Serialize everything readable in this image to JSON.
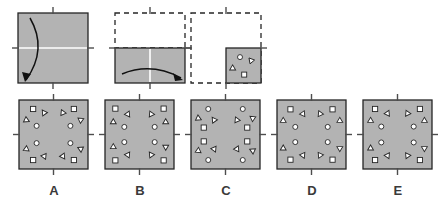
{
  "puzzle": {
    "type": "paper-folding-hole-punch",
    "fill_color": "#b3b3b3",
    "stroke_color": "#262626",
    "fold_line_color": "#ffffff",
    "tick_color": "#4d4d4d",
    "background_color": "#ffffff",
    "shape_fill": "#ffffff",
    "shape_stroke": "#262626"
  },
  "prompt_row": {
    "name": "folding-sequence",
    "steps": [
      {
        "id": "step-1",
        "name": "unfolded-sheet-with-horizontal-fold",
        "square": {
          "x": 18,
          "y": 13,
          "size": 70
        },
        "filled": true,
        "outline_style": "solid",
        "fold_lines": [
          {
            "orientation": "horizontal",
            "position": 0.5
          }
        ],
        "ticks": [
          "top",
          "bottom",
          "left",
          "right"
        ],
        "arrow": {
          "name": "fold-arrow-down",
          "from": [
            30,
            18
          ],
          "to": [
            26,
            80
          ],
          "curve": "bow-left",
          "description": "top edge folds down to bottom"
        }
      },
      {
        "id": "step-2",
        "name": "half-folded-sheet-with-vertical-fold",
        "square": {
          "x": 115,
          "y": 13,
          "size": 70
        },
        "dashed_region": {
          "x": 115,
          "y": 13,
          "width": 70,
          "height": 35
        },
        "filled_region": {
          "x": 115,
          "y": 48,
          "width": 70,
          "height": 35
        },
        "outline_style": "dashed-top-solid-bottom",
        "fold_lines": [
          {
            "orientation": "vertical",
            "position": 0.5
          }
        ],
        "ticks": [
          "top",
          "bottom",
          "left",
          "right"
        ],
        "arrow": {
          "name": "fold-arrow-right",
          "from": [
            122,
            74
          ],
          "to": [
            181,
            78
          ],
          "curve": "bow-up",
          "description": "left half folds right onto right half"
        }
      },
      {
        "id": "step-3",
        "name": "folded-quarter-with-punched-holes",
        "square": {
          "x": 191,
          "y": 13,
          "size": 70
        },
        "dashed_region": {
          "x": 191,
          "y": 13,
          "width": 70,
          "height": 70
        },
        "filled_region": {
          "x": 226,
          "y": 48,
          "width": 35,
          "height": 35
        },
        "outline_style": "dashed-with-solid-quarter",
        "ticks": [
          "top",
          "bottom",
          "left",
          "right"
        ],
        "holes": [
          {
            "shape": "circle",
            "x": 0.4,
            "y": 0.26,
            "size": 5.0,
            "rotation": 0
          },
          {
            "shape": "triangle",
            "x": 0.72,
            "y": 0.36,
            "size": 5.5,
            "rotation": 200
          },
          {
            "shape": "triangle",
            "x": 0.19,
            "y": 0.58,
            "size": 5.5,
            "rotation": 120
          },
          {
            "shape": "square",
            "x": 0.52,
            "y": 0.76,
            "size": 5.0,
            "rotation": 0
          }
        ]
      }
    ]
  },
  "options_row": {
    "name": "answer-options",
    "square_size": 69,
    "square_top": 100,
    "options": [
      {
        "id": "option-a",
        "label": "A",
        "square": {
          "x": 19,
          "y": 100,
          "size": 69
        },
        "label_x": 19,
        "label_y": 183,
        "ticks": [
          "top",
          "bottom",
          "left",
          "right"
        ],
        "holes": [
          {
            "shape": "square",
            "x": 0.205,
            "y": 0.13,
            "size": 5.2,
            "rotation": 0
          },
          {
            "shape": "triangle",
            "x": 0.365,
            "y": 0.185,
            "size": 5.4,
            "rotation": 205
          },
          {
            "shape": "triangle",
            "x": 0.105,
            "y": 0.29,
            "size": 5.4,
            "rotation": 115
          },
          {
            "shape": "circle",
            "x": 0.255,
            "y": 0.375,
            "size": 5.0,
            "rotation": 0
          },
          {
            "shape": "square",
            "x": 0.795,
            "y": 0.13,
            "size": 5.2,
            "rotation": 0
          },
          {
            "shape": "triangle",
            "x": 0.635,
            "y": 0.185,
            "size": 5.4,
            "rotation": 335
          },
          {
            "shape": "triangle",
            "x": 0.895,
            "y": 0.29,
            "size": 5.4,
            "rotation": 65
          },
          {
            "shape": "circle",
            "x": 0.745,
            "y": 0.375,
            "size": 5.0,
            "rotation": 0
          },
          {
            "shape": "square",
            "x": 0.205,
            "y": 0.87,
            "size": 5.2,
            "rotation": 0
          },
          {
            "shape": "triangle",
            "x": 0.365,
            "y": 0.815,
            "size": 5.4,
            "rotation": 155
          },
          {
            "shape": "triangle",
            "x": 0.105,
            "y": 0.71,
            "size": 5.4,
            "rotation": 245
          },
          {
            "shape": "circle",
            "x": 0.255,
            "y": 0.625,
            "size": 5.0,
            "rotation": 0
          },
          {
            "shape": "square",
            "x": 0.795,
            "y": 0.87,
            "size": 5.2,
            "rotation": 0
          },
          {
            "shape": "triangle",
            "x": 0.635,
            "y": 0.815,
            "size": 5.4,
            "rotation": 25
          },
          {
            "shape": "triangle",
            "x": 0.895,
            "y": 0.71,
            "size": 5.4,
            "rotation": 295
          },
          {
            "shape": "circle",
            "x": 0.745,
            "y": 0.625,
            "size": 5.0,
            "rotation": 0
          }
        ]
      },
      {
        "id": "option-b",
        "label": "B",
        "square": {
          "x": 105,
          "y": 100,
          "size": 69
        },
        "label_x": 105,
        "label_y": 183,
        "ticks": [
          "top",
          "bottom",
          "left",
          "right"
        ],
        "holes": [
          {
            "shape": "square",
            "x": 0.15,
            "y": 0.125,
            "size": 5.2,
            "rotation": 0
          },
          {
            "shape": "triangle",
            "x": 0.33,
            "y": 0.205,
            "size": 5.4,
            "rotation": 25
          },
          {
            "shape": "triangle",
            "x": 0.12,
            "y": 0.32,
            "size": 5.4,
            "rotation": 120
          },
          {
            "shape": "circle",
            "x": 0.28,
            "y": 0.39,
            "size": 5.0,
            "rotation": 0
          },
          {
            "shape": "square",
            "x": 0.85,
            "y": 0.125,
            "size": 5.2,
            "rotation": 0
          },
          {
            "shape": "triangle",
            "x": 0.67,
            "y": 0.205,
            "size": 5.4,
            "rotation": 335
          },
          {
            "shape": "triangle",
            "x": 0.88,
            "y": 0.32,
            "size": 5.4,
            "rotation": 240
          },
          {
            "shape": "circle",
            "x": 0.72,
            "y": 0.39,
            "size": 5.0,
            "rotation": 0
          },
          {
            "shape": "square",
            "x": 0.15,
            "y": 0.875,
            "size": 5.2,
            "rotation": 0
          },
          {
            "shape": "triangle",
            "x": 0.33,
            "y": 0.795,
            "size": 5.4,
            "rotation": 155
          },
          {
            "shape": "triangle",
            "x": 0.12,
            "y": 0.68,
            "size": 5.4,
            "rotation": 240
          },
          {
            "shape": "circle",
            "x": 0.28,
            "y": 0.61,
            "size": 5.0,
            "rotation": 0
          },
          {
            "shape": "square",
            "x": 0.85,
            "y": 0.875,
            "size": 5.2,
            "rotation": 0
          },
          {
            "shape": "triangle",
            "x": 0.67,
            "y": 0.795,
            "size": 5.4,
            "rotation": 205
          },
          {
            "shape": "triangle",
            "x": 0.88,
            "y": 0.68,
            "size": 5.4,
            "rotation": 300
          },
          {
            "shape": "circle",
            "x": 0.72,
            "y": 0.61,
            "size": 5.0,
            "rotation": 0
          }
        ]
      },
      {
        "id": "option-c",
        "label": "C",
        "square": {
          "x": 191,
          "y": 100,
          "size": 69
        },
        "label_x": 191,
        "label_y": 183,
        "ticks": [
          "top",
          "bottom",
          "left",
          "right"
        ],
        "holes": [
          {
            "shape": "circle",
            "x": 0.25,
            "y": 0.13,
            "size": 5.0,
            "rotation": 0
          },
          {
            "shape": "triangle",
            "x": 0.105,
            "y": 0.265,
            "size": 5.4,
            "rotation": 115
          },
          {
            "shape": "triangle",
            "x": 0.335,
            "y": 0.29,
            "size": 5.4,
            "rotation": 205
          },
          {
            "shape": "square",
            "x": 0.185,
            "y": 0.4,
            "size": 5.2,
            "rotation": 0
          },
          {
            "shape": "circle",
            "x": 0.75,
            "y": 0.13,
            "size": 5.0,
            "rotation": 0
          },
          {
            "shape": "triangle",
            "x": 0.895,
            "y": 0.265,
            "size": 5.4,
            "rotation": 65
          },
          {
            "shape": "triangle",
            "x": 0.665,
            "y": 0.29,
            "size": 5.4,
            "rotation": 335
          },
          {
            "shape": "square",
            "x": 0.815,
            "y": 0.4,
            "size": 5.2,
            "rotation": 0
          },
          {
            "shape": "circle",
            "x": 0.25,
            "y": 0.87,
            "size": 5.0,
            "rotation": 0
          },
          {
            "shape": "triangle",
            "x": 0.105,
            "y": 0.735,
            "size": 5.4,
            "rotation": 245
          },
          {
            "shape": "triangle",
            "x": 0.335,
            "y": 0.71,
            "size": 5.4,
            "rotation": 155
          },
          {
            "shape": "square",
            "x": 0.185,
            "y": 0.6,
            "size": 5.2,
            "rotation": 0
          },
          {
            "shape": "circle",
            "x": 0.75,
            "y": 0.87,
            "size": 5.0,
            "rotation": 0
          },
          {
            "shape": "triangle",
            "x": 0.895,
            "y": 0.735,
            "size": 5.4,
            "rotation": 295
          },
          {
            "shape": "triangle",
            "x": 0.665,
            "y": 0.71,
            "size": 5.4,
            "rotation": 25
          },
          {
            "shape": "square",
            "x": 0.815,
            "y": 0.6,
            "size": 5.2,
            "rotation": 0
          }
        ]
      },
      {
        "id": "option-d",
        "label": "D",
        "square": {
          "x": 277,
          "y": 100,
          "size": 69
        },
        "label_x": 277,
        "label_y": 183,
        "ticks": [
          "top",
          "bottom",
          "left",
          "right"
        ],
        "holes": [
          {
            "shape": "square",
            "x": 0.195,
            "y": 0.135,
            "size": 5.2,
            "rotation": 0
          },
          {
            "shape": "triangle",
            "x": 0.375,
            "y": 0.2,
            "size": 5.4,
            "rotation": 25
          },
          {
            "shape": "triangle",
            "x": 0.09,
            "y": 0.3,
            "size": 5.4,
            "rotation": 120
          },
          {
            "shape": "circle",
            "x": 0.265,
            "y": 0.39,
            "size": 5.0,
            "rotation": 0
          },
          {
            "shape": "square",
            "x": 0.805,
            "y": 0.135,
            "size": 5.2,
            "rotation": 0
          },
          {
            "shape": "triangle",
            "x": 0.625,
            "y": 0.2,
            "size": 5.4,
            "rotation": 335
          },
          {
            "shape": "triangle",
            "x": 0.91,
            "y": 0.3,
            "size": 5.4,
            "rotation": 240
          },
          {
            "shape": "circle",
            "x": 0.735,
            "y": 0.39,
            "size": 5.0,
            "rotation": 0
          },
          {
            "shape": "square",
            "x": 0.195,
            "y": 0.865,
            "size": 5.2,
            "rotation": 0
          },
          {
            "shape": "triangle",
            "x": 0.375,
            "y": 0.8,
            "size": 5.4,
            "rotation": 155
          },
          {
            "shape": "triangle",
            "x": 0.09,
            "y": 0.7,
            "size": 5.4,
            "rotation": 240
          },
          {
            "shape": "circle",
            "x": 0.265,
            "y": 0.61,
            "size": 5.0,
            "rotation": 0
          },
          {
            "shape": "square",
            "x": 0.805,
            "y": 0.865,
            "size": 5.2,
            "rotation": 0
          },
          {
            "shape": "triangle",
            "x": 0.625,
            "y": 0.8,
            "size": 5.4,
            "rotation": 205
          },
          {
            "shape": "triangle",
            "x": 0.91,
            "y": 0.7,
            "size": 5.4,
            "rotation": 300
          },
          {
            "shape": "circle",
            "x": 0.735,
            "y": 0.61,
            "size": 5.0,
            "rotation": 0
          }
        ]
      },
      {
        "id": "option-e",
        "label": "E",
        "square": {
          "x": 363,
          "y": 100,
          "size": 69
        },
        "label_x": 363,
        "label_y": 183,
        "ticks": [
          "top",
          "bottom",
          "left",
          "right"
        ],
        "holes": [
          {
            "shape": "square",
            "x": 0.175,
            "y": 0.13,
            "size": 5.2,
            "rotation": 0
          },
          {
            "shape": "triangle",
            "x": 0.355,
            "y": 0.195,
            "size": 5.4,
            "rotation": 25
          },
          {
            "shape": "triangle",
            "x": 0.11,
            "y": 0.3,
            "size": 5.4,
            "rotation": 120
          },
          {
            "shape": "circle",
            "x": 0.265,
            "y": 0.385,
            "size": 5.0,
            "rotation": 0
          },
          {
            "shape": "square",
            "x": 0.825,
            "y": 0.13,
            "size": 5.2,
            "rotation": 0
          },
          {
            "shape": "triangle",
            "x": 0.645,
            "y": 0.195,
            "size": 5.4,
            "rotation": 335
          },
          {
            "shape": "triangle",
            "x": 0.89,
            "y": 0.3,
            "size": 5.4,
            "rotation": 240
          },
          {
            "shape": "circle",
            "x": 0.735,
            "y": 0.385,
            "size": 5.0,
            "rotation": 0
          },
          {
            "shape": "square",
            "x": 0.175,
            "y": 0.87,
            "size": 5.2,
            "rotation": 0
          },
          {
            "shape": "triangle",
            "x": 0.355,
            "y": 0.805,
            "size": 5.4,
            "rotation": 155
          },
          {
            "shape": "triangle",
            "x": 0.11,
            "y": 0.7,
            "size": 5.4,
            "rotation": 240
          },
          {
            "shape": "circle",
            "x": 0.265,
            "y": 0.615,
            "size": 5.0,
            "rotation": 0
          },
          {
            "shape": "square",
            "x": 0.825,
            "y": 0.87,
            "size": 5.2,
            "rotation": 0
          },
          {
            "shape": "triangle",
            "x": 0.645,
            "y": 0.805,
            "size": 5.4,
            "rotation": 205
          },
          {
            "shape": "triangle",
            "x": 0.89,
            "y": 0.7,
            "size": 5.4,
            "rotation": 300
          },
          {
            "shape": "circle",
            "x": 0.735,
            "y": 0.615,
            "size": 5.0,
            "rotation": 0
          }
        ]
      }
    ]
  }
}
